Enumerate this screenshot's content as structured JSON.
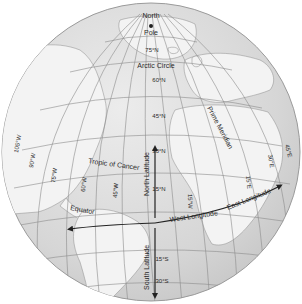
{
  "diagram": {
    "type": "globe-graticule",
    "colors": {
      "background": "#ffffff",
      "ocean": "#dcdcdc",
      "land": "#f2f2f2",
      "land_stroke": "#9a9a9a",
      "grid": "#8c8c8c",
      "arrow": "#222222",
      "text": "#2a2a2a"
    },
    "pole": {
      "line1": "North",
      "line2": "Pole"
    },
    "circles": {
      "arctic": "Arctic Circle",
      "tropic": "Tropic of Cancer",
      "equator": "Equator"
    },
    "meridian": "Prime Meridian",
    "latitude_labels": {
      "n75": "75°N",
      "n60": "60°N",
      "n45": "45°N",
      "n30": "30°N",
      "n15": "15°N",
      "s15": "15°S",
      "s30": "30°S"
    },
    "longitude_labels": {
      "w105": "105°W",
      "w90": "90°W",
      "w75": "75°W",
      "w60": "60°W",
      "w45": "45°W",
      "w15": "15°W",
      "e15": "15°E",
      "e30": "30°E",
      "e45": "45°E"
    },
    "arrows": {
      "north_latitude": "North Latitude",
      "south_latitude": "South Latitude",
      "west_longitude": "West Longitude",
      "east_longitude": "East Longitude"
    }
  }
}
